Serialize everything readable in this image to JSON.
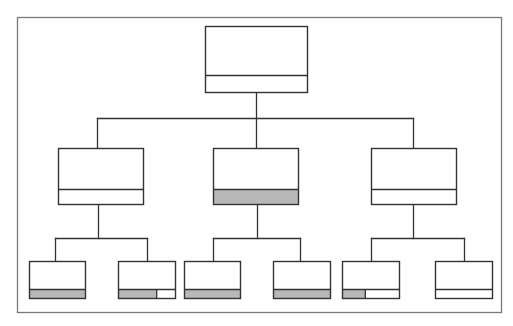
{
  "diagram": {
    "type": "org-chart-tree",
    "colors": {
      "frame": "#7a7a7a",
      "line": "#333333",
      "box_fill": "#ffffff",
      "highlight_fill": "#b8b8b8"
    },
    "frame": {
      "x": 17,
      "y": 17,
      "w": 484,
      "h": 295
    },
    "nodes": [
      {
        "id": "root",
        "level": 0,
        "x": 205,
        "y": 26,
        "w": 102,
        "h": 66,
        "divider_y": 75,
        "fill_fraction": 0
      },
      {
        "id": "mid-left",
        "level": 1,
        "x": 58,
        "y": 148,
        "w": 85,
        "h": 56,
        "divider_y": 189,
        "fill_fraction": 0
      },
      {
        "id": "mid-center",
        "level": 1,
        "x": 213,
        "y": 148,
        "w": 85,
        "h": 56,
        "divider_y": 189,
        "fill_fraction": 1
      },
      {
        "id": "mid-right",
        "level": 1,
        "x": 371,
        "y": 148,
        "w": 85,
        "h": 56,
        "divider_y": 189,
        "fill_fraction": 0
      },
      {
        "id": "leaf-1",
        "level": 2,
        "x": 29,
        "y": 261,
        "w": 56,
        "h": 37,
        "divider_y": 289,
        "fill_fraction": 1
      },
      {
        "id": "leaf-2",
        "level": 2,
        "x": 118,
        "y": 261,
        "w": 57,
        "h": 37,
        "divider_y": 289,
        "fill_fraction": 0.67
      },
      {
        "id": "leaf-3",
        "level": 2,
        "x": 184,
        "y": 261,
        "w": 56,
        "h": 37,
        "divider_y": 289,
        "fill_fraction": 1
      },
      {
        "id": "leaf-4",
        "level": 2,
        "x": 273,
        "y": 261,
        "w": 57,
        "h": 37,
        "divider_y": 289,
        "fill_fraction": 1
      },
      {
        "id": "leaf-5",
        "level": 2,
        "x": 342,
        "y": 261,
        "w": 57,
        "h": 37,
        "divider_y": 289,
        "fill_fraction": 0.4
      },
      {
        "id": "leaf-6",
        "level": 2,
        "x": 435,
        "y": 261,
        "w": 57,
        "h": 37,
        "divider_y": 289,
        "fill_fraction": 0
      }
    ],
    "edges": [
      {
        "from": "root",
        "to": "mid-left"
      },
      {
        "from": "root",
        "to": "mid-center"
      },
      {
        "from": "root",
        "to": "mid-right"
      },
      {
        "from": "mid-left",
        "to": "leaf-1"
      },
      {
        "from": "mid-left",
        "to": "leaf-2"
      },
      {
        "from": "mid-center",
        "to": "leaf-3"
      },
      {
        "from": "mid-center",
        "to": "leaf-4"
      },
      {
        "from": "mid-right",
        "to": "leaf-5"
      },
      {
        "from": "mid-right",
        "to": "leaf-6"
      }
    ],
    "connectors": [
      {
        "id": "root-stem",
        "x1": 256,
        "y1": 92,
        "x2": 256,
        "y2": 118
      },
      {
        "id": "level1-bus",
        "x1": 97,
        "y1": 118,
        "x2": 413,
        "y2": 118
      },
      {
        "id": "drop-mid-left",
        "x1": 97,
        "y1": 118,
        "x2": 97,
        "y2": 148
      },
      {
        "id": "drop-mid-center",
        "x1": 256,
        "y1": 118,
        "x2": 256,
        "y2": 148
      },
      {
        "id": "drop-mid-right",
        "x1": 413,
        "y1": 118,
        "x2": 413,
        "y2": 148
      },
      {
        "id": "stem-mid-left",
        "x1": 98,
        "y1": 204,
        "x2": 98,
        "y2": 238
      },
      {
        "id": "bus-left",
        "x1": 55,
        "y1": 238,
        "x2": 147,
        "y2": 238
      },
      {
        "id": "drop-leaf-1",
        "x1": 55,
        "y1": 238,
        "x2": 55,
        "y2": 261
      },
      {
        "id": "drop-leaf-2",
        "x1": 147,
        "y1": 238,
        "x2": 147,
        "y2": 261
      },
      {
        "id": "stem-mid-center",
        "x1": 257,
        "y1": 204,
        "x2": 257,
        "y2": 238
      },
      {
        "id": "bus-center",
        "x1": 213,
        "y1": 238,
        "x2": 300,
        "y2": 238
      },
      {
        "id": "drop-leaf-3",
        "x1": 213,
        "y1": 238,
        "x2": 213,
        "y2": 261
      },
      {
        "id": "drop-leaf-4",
        "x1": 300,
        "y1": 238,
        "x2": 300,
        "y2": 261
      },
      {
        "id": "stem-mid-right",
        "x1": 413,
        "y1": 204,
        "x2": 413,
        "y2": 238
      },
      {
        "id": "bus-right",
        "x1": 371,
        "y1": 238,
        "x2": 464,
        "y2": 238
      },
      {
        "id": "drop-leaf-5",
        "x1": 371,
        "y1": 238,
        "x2": 371,
        "y2": 261
      },
      {
        "id": "drop-leaf-6",
        "x1": 464,
        "y1": 238,
        "x2": 464,
        "y2": 261
      }
    ]
  }
}
